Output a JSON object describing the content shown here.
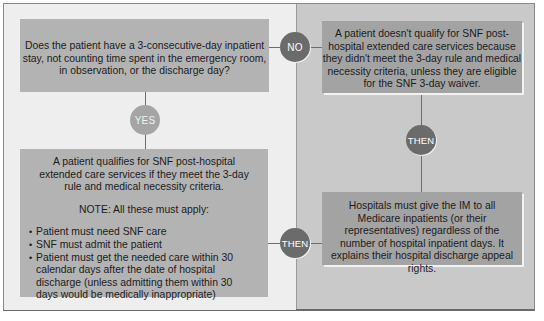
{
  "diagram": {
    "question": {
      "text": "Does the patient have a 3-consecutive-day inpatient stay, not counting time spent in the emergency room, in observation, or the discharge day?"
    },
    "connectors": {
      "no": "NO",
      "yes": "YES",
      "then_right": "THEN",
      "then_bottom": "THEN"
    },
    "no_outcome": {
      "text": "A patient doesn't qualify for SNF post-hospital extended care services because they didn't meet the 3-day rule and medical necessity criteria, unless they are eligible for the SNF 3-day waiver."
    },
    "yes_outcome": {
      "text": "A patient qualifies for SNF post-hospital extended care services if they meet the 3-day rule and medical necessity criteria.",
      "note": "NOTE: All these must apply:",
      "bullets": [
        "Patient must need SNF care",
        "SNF must admit the patient",
        "Patient must get the needed care within 30 calendar days after the date of hospital discharge (unless admitting them within 30 days would be medically inappropriate)"
      ]
    },
    "im_outcome": {
      "text": "Hospitals must give the IM to all Medicare inpatients (or their representatives) regardless of the number of hospital inpatient days. It explains their hospital discharge appeal rights."
    },
    "colors": {
      "left_panel": "#eeeeee",
      "right_panel": "#c9c9c9",
      "box_left": "#b3b3b3",
      "box_right": "#a3a3a3",
      "circle_dark": "#6b6b6b",
      "circle_light": "#a5a5a5"
    }
  }
}
